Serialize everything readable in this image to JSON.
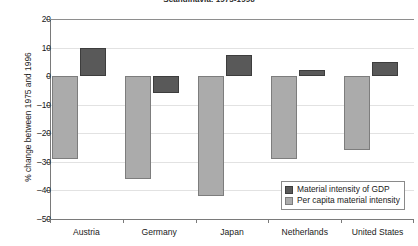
{
  "chart_data": {
    "type": "bar",
    "title": "Scandinavia, 1975-1996",
    "xlabel": "",
    "ylabel": "% change between 1975 and 1996",
    "ylim": [
      -50,
      20
    ],
    "yticks": [
      20,
      10,
      0,
      -10,
      -20,
      -30,
      -40,
      -50
    ],
    "ytick_labels": [
      "20",
      "10",
      "0",
      "–10",
      "–20",
      "–30",
      "–40",
      "–50"
    ],
    "grid": true,
    "legend_position": "lower right",
    "categories": [
      "Austria",
      "Germany",
      "Japan",
      "Netherlands",
      "United States"
    ],
    "series": [
      {
        "name": "Material intensity of GDP",
        "color": "#595959",
        "values": [
          10,
          -6,
          7.5,
          2,
          5
        ]
      },
      {
        "name": "Per capita material intensity",
        "color": "#ababab",
        "values": [
          -29,
          -36,
          -42,
          -29,
          -26
        ]
      }
    ]
  },
  "axis": {
    "zero_label": "0"
  },
  "colors": {
    "dark_series": "#595959",
    "light_series": "#ababab",
    "axis": "#7a7a7a",
    "gridline": "#e2e2e2"
  }
}
